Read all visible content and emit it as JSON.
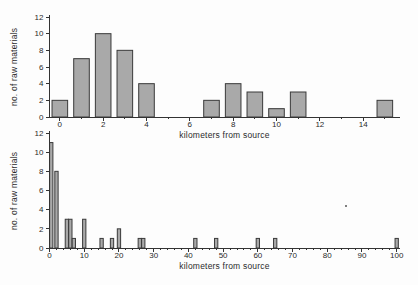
{
  "figure": {
    "background": "#fdfdfd",
    "bar_fill": "#a9a9a9",
    "bar_stroke": "#3a3a3a",
    "axis_color": "#333333",
    "text_color": "#2b2b2b"
  },
  "chart_data": [
    {
      "type": "bar",
      "title": "",
      "xlabel": "kilometers from source",
      "ylabel": "no. of raw materials",
      "x": [
        0,
        1,
        2,
        3,
        4,
        7,
        8,
        9,
        10,
        11,
        15
      ],
      "values": [
        2,
        7,
        10,
        8,
        4,
        2,
        4,
        3,
        1,
        3,
        2
      ],
      "xlim": [
        -0.5,
        15.7
      ],
      "ylim": [
        0,
        12
      ],
      "xticks_major": [
        0,
        2,
        4,
        6,
        8,
        10,
        12,
        14
      ],
      "xticks_minor_step": 1,
      "yticks": [
        0,
        2,
        4,
        6,
        8,
        10,
        12
      ],
      "bar_width": 0.72,
      "grid": false,
      "legend": null
    },
    {
      "type": "bar",
      "title": "",
      "xlabel": "kilometers from source",
      "ylabel": "no. of raw materials",
      "x": [
        0,
        2,
        5,
        6,
        7,
        10,
        15,
        18,
        20,
        26,
        27,
        42,
        48,
        60,
        65,
        100
      ],
      "values": [
        11,
        8,
        3,
        3,
        1,
        3,
        1,
        1,
        2,
        1,
        1,
        1,
        1,
        1,
        1,
        1
      ],
      "xlim": [
        -0.15,
        100.95
      ],
      "ylim": [
        0,
        12
      ],
      "xticks_major": [
        0,
        10,
        20,
        30,
        40,
        50,
        60,
        70,
        80,
        90,
        100
      ],
      "xticks_minor_step": 2,
      "yticks": [
        0,
        2,
        4,
        6,
        8,
        10,
        12
      ],
      "bar_width": 0.95,
      "grid": false,
      "legend": null
    }
  ]
}
